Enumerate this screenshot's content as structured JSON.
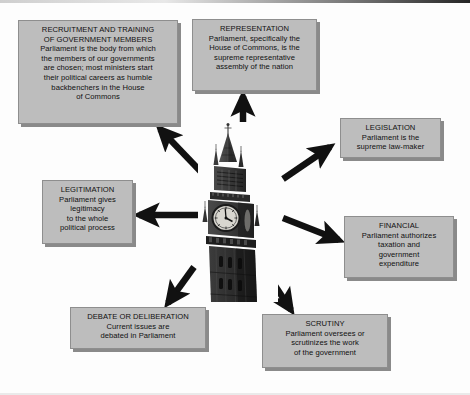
{
  "diagram": {
    "center": {
      "label": "big-ben-clock-tower-photo",
      "description": "Black and white photograph of the Big Ben clock tower, Palace of Westminster"
    },
    "background_color": "#fdfdfd",
    "node_fill_color": "#bdbdbd",
    "node_border_color": "#8e8e8e",
    "node_shadow_color": "#8a8a8a",
    "arrow_color": "#111111",
    "nodes": [
      {
        "id": "recruitment",
        "heading": "RECRUITMENT AND TRAINING\nOF GOVERNMENT MEMBERS",
        "body": "Parliament is the body from which\nthe members of our governments\nare chosen; most ministers start\ntheir political careers as humble\nbackbenchers in the House\nof Commons",
        "arrow_direction": "up-left"
      },
      {
        "id": "representation",
        "heading": "REPRESENTATION",
        "body": "Parliament, specifically the\nHouse of Commons, is the\nsupreme representative\nassembly of the nation",
        "arrow_direction": "up"
      },
      {
        "id": "legislation",
        "heading": "LEGISLATION",
        "body": "Parliament is the\nsupreme law-maker",
        "arrow_direction": "up-right"
      },
      {
        "id": "financial",
        "heading": "FINANCIAL",
        "body": "Parliament authorizes\ntaxation and\ngovernment\nexpenditure",
        "arrow_direction": "down-right"
      },
      {
        "id": "scrutiny",
        "heading": "SCRUTINY",
        "body": "Parliament oversees or\nscrutinizes the work\nof the government",
        "arrow_direction": "down-right"
      },
      {
        "id": "debate",
        "heading": "DEBATE OR DELIBERATION",
        "body": "Current issues are\ndebated in Parliament",
        "arrow_direction": "down-left"
      },
      {
        "id": "legitimation",
        "heading": "LEGITIMATION",
        "body": "Parliament gives\nlegitimacy\nto the whole\npolitical process",
        "arrow_direction": "left"
      }
    ]
  }
}
